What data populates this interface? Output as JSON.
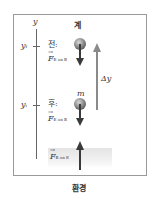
{
  "diagram": {
    "system_label": "계",
    "environment_label": "환경",
    "axis": {
      "label": "y",
      "final_tick": "y",
      "final_sub": "f",
      "initial_tick": "y",
      "initial_sub": "i"
    },
    "before": {
      "label": "전:",
      "force_symbol": "F",
      "force_sub": "E on B"
    },
    "after": {
      "label": "후:",
      "force_symbol": "F",
      "force_sub": "E on B",
      "mass_label": "m"
    },
    "ground_force": {
      "force_symbol": "F",
      "force_sub": "B on E"
    },
    "displacement_label": "Δy",
    "colors": {
      "frame": "#9a9a9a",
      "arrow_dark": "#3a3a3a",
      "arrow_light": "#8a8a8a",
      "sphere": "#9a9a9a",
      "ground": "#e4e4e4"
    }
  }
}
